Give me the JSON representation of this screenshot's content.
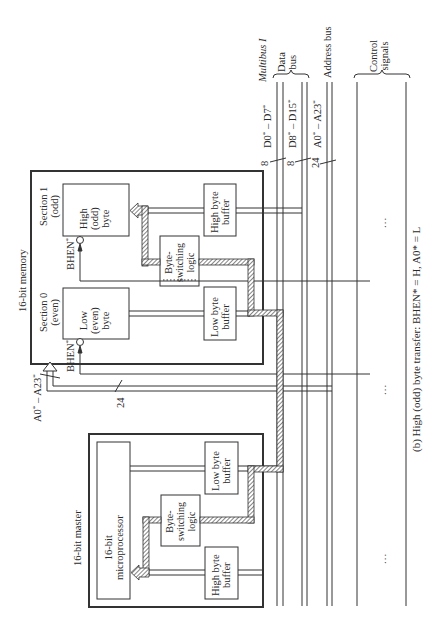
{
  "caption": "(b) High (odd) byte transfer: BHEN* = H, A0* = L",
  "bus": {
    "title": "Multibus I",
    "data_bus_label_line1": "Data",
    "data_bus_label_line2": "bus",
    "address_bus_label": "Address bus",
    "control_label_line1": "Control",
    "control_label_line2": "signals",
    "d_low": {
      "name": "D0",
      "end": "D7",
      "width": "8"
    },
    "d_high": {
      "name": "D8",
      "end": "D15",
      "width": "8"
    },
    "addr": {
      "name": "A0",
      "end": "A23",
      "width": "24"
    },
    "ellipsis": "..."
  },
  "memory": {
    "title": "16-bit memory",
    "section1_line1": "Section 1",
    "section1_line2": "(odd)",
    "section0_line1": "Section 0",
    "section0_line2": "(even)",
    "high_byte_line1": "High",
    "high_byte_line2": "(odd)",
    "high_byte_line3": "byte",
    "low_byte_line1": "Low",
    "low_byte_line2": "(even)",
    "low_byte_line3": "byte",
    "high_buffer_line1": "High byte",
    "high_buffer_line2": "buffer",
    "low_buffer_line1": "Low byte",
    "low_buffer_line2": "buffer",
    "switch_line1": "Byte-",
    "switch_line2": "switching",
    "switch_line3": "logic",
    "bhen_label": "BHEN",
    "addr_in_name": "A0",
    "addr_in_end": "A23",
    "addr_in_width": "24"
  },
  "master": {
    "title": "16-bit master",
    "cpu_line1": "16-bit",
    "cpu_line2": "microprocessor",
    "low_buffer_line1": "Low byte",
    "low_buffer_line2": "buffer",
    "high_buffer_line1": "High byte",
    "high_buffer_line2": "buffer",
    "switch_line1": "Byte-",
    "switch_line2": "switching",
    "switch_line3": "logic"
  }
}
